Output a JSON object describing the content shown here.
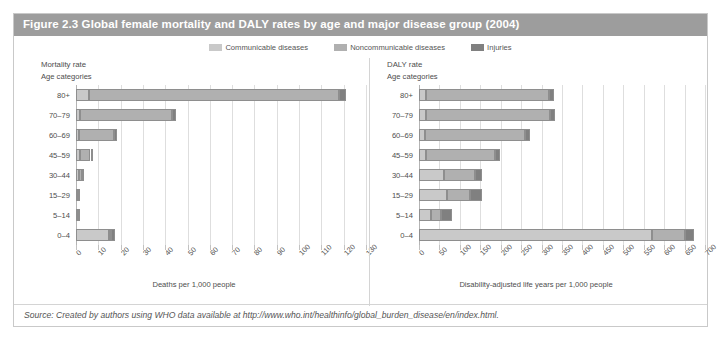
{
  "figure": {
    "title": "Figure 2.3 Global female mortality and DALY rates by age and major disease group (2004)",
    "source": "Source: Created by authors using WHO data available at http://www.who.int/healthinfo/global_burden_disease/en/index.html.",
    "title_bar_color": "#9d9d9d"
  },
  "legend": {
    "items": [
      {
        "label": "Communicable diseases",
        "color": "#c9c9c9"
      },
      {
        "label": "Noncommunicable diseases",
        "color": "#b0b0b0"
      },
      {
        "label": "Injuries",
        "color": "#808080"
      }
    ]
  },
  "chart_data": [
    {
      "type": "bar",
      "orientation": "horizontal",
      "stacked": true,
      "title": "Mortality rate",
      "ylabel": "Age categories",
      "xlabel": "Deaths per 1,000 people",
      "categories": [
        "80+",
        "70–79",
        "60–69",
        "45–59",
        "30–44",
        "15–29",
        "5–14",
        "0–4"
      ],
      "xlim": [
        0,
        130
      ],
      "xticks": [
        0,
        10,
        20,
        30,
        40,
        50,
        60,
        70,
        80,
        90,
        100,
        110,
        120,
        130
      ],
      "grid": true,
      "legend_position": "top-center",
      "series": [
        {
          "name": "Communicable diseases",
          "color": "#c9c9c9",
          "values": [
            6.0,
            2.0,
            1.5,
            2.0,
            1.5,
            0.6,
            0.7,
            15.0
          ]
        },
        {
          "name": "Noncommunicable diseases",
          "color": "#b0b0b0",
          "values": [
            112.0,
            41.0,
            15.5,
            4.5,
            1.2,
            0.5,
            0.4,
            0.6
          ]
        },
        {
          "name": "Injuries",
          "color": "#808080",
          "values": [
            3.0,
            2.0,
            1.5,
            1.0,
            0.8,
            0.9,
            0.6,
            1.8
          ]
        }
      ],
      "totals": [
        121.0,
        45.0,
        18.5,
        7.5,
        3.5,
        2.0,
        1.7,
        17.4
      ]
    },
    {
      "type": "bar",
      "orientation": "horizontal",
      "stacked": true,
      "title": "DALY rate",
      "ylabel": "Age categories",
      "xlabel": "Disability-adjusted life years per 1,000 people",
      "categories": [
        "80+",
        "70–79",
        "60–69",
        "45–59",
        "30–44",
        "15–29",
        "5–14",
        "0–4"
      ],
      "xlim": [
        0,
        700
      ],
      "xticks": [
        0,
        50,
        100,
        150,
        200,
        250,
        300,
        350,
        400,
        450,
        500,
        550,
        600,
        650,
        700
      ],
      "grid": true,
      "legend_position": "top-center",
      "series": [
        {
          "name": "Communicable diseases",
          "color": "#c9c9c9",
          "values": [
            18.0,
            16.0,
            14.0,
            18.0,
            60.0,
            68.0,
            30.0,
            570.0
          ]
        },
        {
          "name": "Noncommunicable diseases",
          "color": "#b0b0b0",
          "values": [
            300.0,
            305.0,
            245.0,
            168.0,
            77.0,
            58.0,
            25.0,
            80.0
          ]
        },
        {
          "name": "Injuries",
          "color": "#808080",
          "values": [
            12.0,
            13.0,
            12.0,
            12.0,
            18.0,
            28.0,
            25.0,
            22.0
          ]
        }
      ],
      "totals": [
        330.0,
        334.0,
        271.0,
        198.0,
        155.0,
        154.0,
        80.0,
        672.0
      ]
    }
  ]
}
